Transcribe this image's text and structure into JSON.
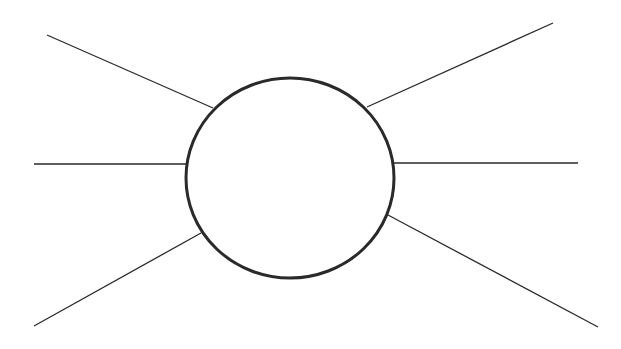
{
  "diagram": {
    "type": "spider-map",
    "background": "#ffffff",
    "stroke_color": "#2a2a2a",
    "center_node": {
      "cx": 290,
      "cy": 178,
      "rx": 104,
      "ry": 100,
      "label": ""
    },
    "legs": [
      {
        "name": "upper-left",
        "x1": 47,
        "y1": 35,
        "x2": 213,
        "y2": 108
      },
      {
        "name": "middle-left",
        "x1": 34,
        "y1": 164,
        "x2": 187,
        "y2": 164
      },
      {
        "name": "lower-left",
        "x1": 34,
        "y1": 326,
        "x2": 201,
        "y2": 233
      },
      {
        "name": "upper-right",
        "x1": 367,
        "y1": 107,
        "x2": 553,
        "y2": 23
      },
      {
        "name": "middle-right",
        "x1": 394,
        "y1": 163,
        "x2": 578,
        "y2": 163
      },
      {
        "name": "lower-right",
        "x1": 388,
        "y1": 215,
        "x2": 598,
        "y2": 327
      }
    ]
  }
}
